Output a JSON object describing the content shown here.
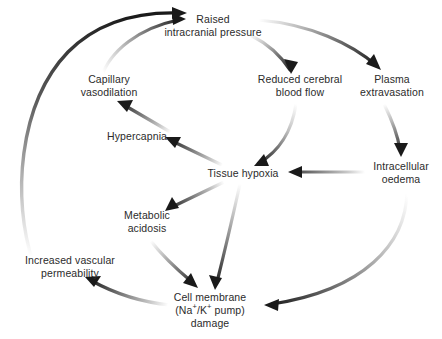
{
  "diagram": {
    "background_color": "#ffffff",
    "text_color": "#2b2b2b",
    "arrow_color_dark": "#1a1a1a",
    "arrow_color_light": "#ffffff",
    "nodes": [
      {
        "id": "raised-icp",
        "label": "Raised\nintracranial pressure",
        "x": 213,
        "y": 26
      },
      {
        "id": "reduced-cerebral-blood-flow",
        "label": "Reduced cerebral\nblood flow",
        "x": 300,
        "y": 86
      },
      {
        "id": "plasma-extravasation",
        "label": "Plasma\nextravasation",
        "x": 392,
        "y": 86
      },
      {
        "id": "capillary-vasodilation",
        "label": "Capillary\nvasodilation",
        "x": 109,
        "y": 86
      },
      {
        "id": "hypercapnia",
        "label": "Hypercapnia",
        "x": 137,
        "y": 136
      },
      {
        "id": "tissue-hypoxia",
        "label": "Tissue hypoxia",
        "x": 243,
        "y": 173
      },
      {
        "id": "intracellular-oedema",
        "label": "Intracellular\noedema",
        "x": 401,
        "y": 173
      },
      {
        "id": "metabolic-acidosis",
        "label": "Metabolic\nacidosis",
        "x": 147,
        "y": 222
      },
      {
        "id": "increased-vascular-permeability",
        "label": "Increased vascular\npermeability",
        "x": 70,
        "y": 267
      },
      {
        "id": "cell-membrane-damage",
        "label_line1": "Cell membrane",
        "label_line2_prefix": "(Na",
        "label_line2_sup1": "+",
        "label_line2_mid": "/K",
        "label_line2_sup2": "+",
        "label_line2_suffix": " pump)",
        "label_line3": "damage",
        "x": 210,
        "y": 310
      }
    ],
    "edges": [
      {
        "id": "edge-icp-to-rcbf",
        "from": "raised-icp",
        "to": "reduced-cerebral-blood-flow"
      },
      {
        "id": "edge-icp-to-plasma",
        "from": "raised-icp",
        "to": "plasma-extravasation"
      },
      {
        "id": "edge-rcbf-to-hypoxia",
        "from": "reduced-cerebral-blood-flow",
        "to": "tissue-hypoxia"
      },
      {
        "id": "edge-plasma-to-oedema",
        "from": "plasma-extravasation",
        "to": "intracellular-oedema"
      },
      {
        "id": "edge-oedema-to-hypoxia",
        "from": "intracellular-oedema",
        "to": "tissue-hypoxia"
      },
      {
        "id": "edge-oedema-to-cellmembrane",
        "from": "intracellular-oedema",
        "to": "cell-membrane-damage"
      },
      {
        "id": "edge-hypoxia-to-hypercapnia",
        "from": "tissue-hypoxia",
        "to": "hypercapnia"
      },
      {
        "id": "edge-hypoxia-to-acidosis",
        "from": "tissue-hypoxia",
        "to": "metabolic-acidosis"
      },
      {
        "id": "edge-hypoxia-to-cellmembrane",
        "from": "tissue-hypoxia",
        "to": "cell-membrane-damage"
      },
      {
        "id": "edge-acidosis-to-cellmembrane",
        "from": "metabolic-acidosis",
        "to": "cell-membrane-damage"
      },
      {
        "id": "edge-hypercapnia-to-vasodilation",
        "from": "hypercapnia",
        "to": "capillary-vasodilation"
      },
      {
        "id": "edge-vasodilation-to-icp",
        "from": "capillary-vasodilation",
        "to": "raised-icp"
      },
      {
        "id": "edge-cellmembrane-to-permeability",
        "from": "cell-membrane-damage",
        "to": "increased-vascular-permeability"
      },
      {
        "id": "edge-permeability-to-icp",
        "from": "increased-vascular-permeability",
        "to": "raised-icp"
      }
    ]
  }
}
